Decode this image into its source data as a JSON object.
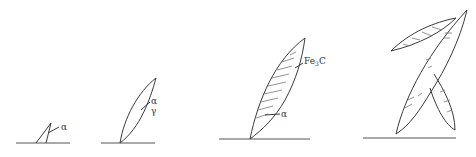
{
  "figure": {
    "title": "",
    "stages": [
      {
        "id": "stage-1",
        "labels": [
          "α"
        ]
      },
      {
        "id": "stage-2",
        "labels": [
          "α",
          "γ"
        ]
      },
      {
        "id": "stage-3",
        "labels": {
          "phase_main": "Fe",
          "phase_sub": "3",
          "phase_tail": "C",
          "matrix": "α"
        }
      },
      {
        "id": "stage-4",
        "labels": []
      }
    ]
  }
}
